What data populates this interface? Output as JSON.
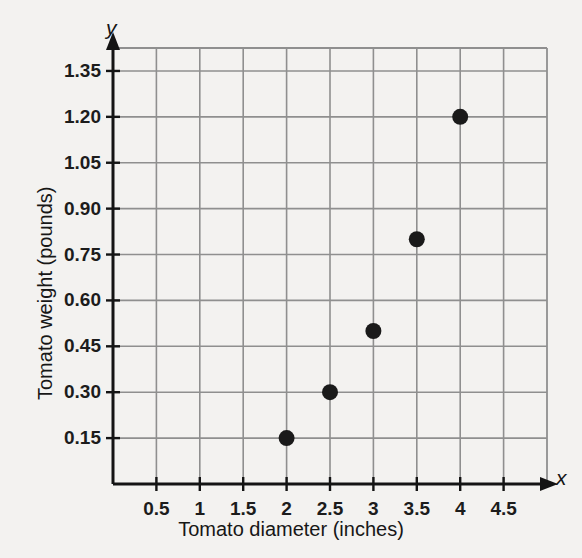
{
  "chart_data": {
    "type": "scatter",
    "title": "",
    "xlabel": "Tomato diameter (inches)",
    "ylabel": "Tomato weight (pounds)",
    "x_axis_variable": "x",
    "y_axis_variable": "y",
    "xlim": [
      0,
      5
    ],
    "ylim": [
      0,
      1.425
    ],
    "xticks": [
      0.5,
      1,
      1.5,
      2,
      2.5,
      3,
      3.5,
      4,
      4.5
    ],
    "xticklabels": [
      "0.5",
      "1",
      "1.5",
      "2",
      "2.5",
      "3",
      "3.5",
      "4",
      "4.5"
    ],
    "yticks": [
      0.15,
      0.3,
      0.45,
      0.6,
      0.75,
      0.9,
      1.05,
      1.2,
      1.35
    ],
    "yticklabels": [
      "0.15",
      "0.30",
      "0.45",
      "0.60",
      "0.75",
      "0.90",
      "1.05",
      "1.20",
      "1.35"
    ],
    "grid": true,
    "legend": false,
    "points": [
      {
        "x": 2,
        "y": 0.15
      },
      {
        "x": 2.5,
        "y": 0.3
      },
      {
        "x": 3,
        "y": 0.5
      },
      {
        "x": 3.5,
        "y": 0.8
      },
      {
        "x": 4,
        "y": 1.2
      }
    ],
    "marker": {
      "shape": "circle",
      "color": "#1a1a1a",
      "radius_px": 8
    },
    "colors": {
      "background": "#f3f2f0",
      "grid": "#8f8f8f",
      "axis": "#141414",
      "text": "#171717"
    }
  }
}
